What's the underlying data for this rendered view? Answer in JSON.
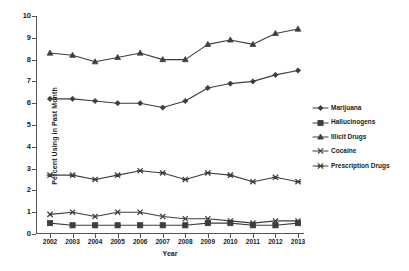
{
  "chart_data": {
    "type": "line",
    "title": "",
    "xlabel": "Year",
    "ylabel": "Percent Using in Past Month",
    "categories": [
      "2002",
      "2003",
      "2004",
      "2005",
      "2006",
      "2007",
      "2008",
      "2009",
      "2010",
      "2011",
      "2012",
      "2013"
    ],
    "xlim": [
      2002,
      2013
    ],
    "ylim": [
      0,
      10
    ],
    "yticks": [
      "0",
      "1",
      "2",
      "3",
      "4",
      "5",
      "6",
      "7",
      "8",
      "9",
      "10"
    ],
    "grid": false,
    "legend_position": "right",
    "series": [
      {
        "name": "Marijuana",
        "marker": "diamond",
        "values": [
          6.2,
          6.2,
          6.1,
          6.0,
          6.0,
          5.8,
          6.1,
          6.7,
          6.9,
          7.0,
          7.3,
          7.5
        ]
      },
      {
        "name": "Hallucinogens",
        "marker": "square",
        "values": [
          0.5,
          0.4,
          0.4,
          0.4,
          0.4,
          0.4,
          0.4,
          0.5,
          0.5,
          0.4,
          0.4,
          0.5
        ]
      },
      {
        "name": "Illicit Drugs",
        "marker": "triangle",
        "values": [
          8.3,
          8.2,
          7.9,
          8.1,
          8.3,
          8.0,
          8.0,
          8.7,
          8.9,
          8.7,
          9.2,
          9.4
        ]
      },
      {
        "name": "Cocaine",
        "marker": "x",
        "values": [
          0.9,
          1.0,
          0.8,
          1.0,
          1.0,
          0.8,
          0.7,
          0.7,
          0.6,
          0.5,
          0.6,
          0.6
        ]
      },
      {
        "name": "Prescription Drugs",
        "marker": "asterisk",
        "values": [
          2.7,
          2.7,
          2.5,
          2.7,
          2.9,
          2.8,
          2.5,
          2.8,
          2.7,
          2.4,
          2.6,
          2.4
        ]
      }
    ]
  },
  "legend": {
    "items": [
      {
        "label": "Marijuana",
        "marker": "diamond"
      },
      {
        "label": "Hallucinogens",
        "marker": "square"
      },
      {
        "label": "Illicit Drugs",
        "marker": "triangle"
      },
      {
        "label": "Cocaine",
        "marker": "x"
      },
      {
        "label": "Prescription Drugs",
        "marker": "asterisk"
      }
    ]
  },
  "colors": {
    "series": "#3d3d3d",
    "axis": "#555555",
    "text": "#1a1a1a",
    "background": "#ffffff"
  }
}
